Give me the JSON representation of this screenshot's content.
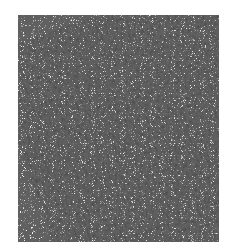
{
  "image": {
    "subject": "textured fabric swatch",
    "description": "Close-up of a light gray knitted/terry cloth texture on white background",
    "colors": {
      "background": "#ffffff",
      "fabric_base": "#ececec",
      "fabric_mid": "#b8b8b8",
      "fabric_dark": "#3a3a3a"
    }
  }
}
